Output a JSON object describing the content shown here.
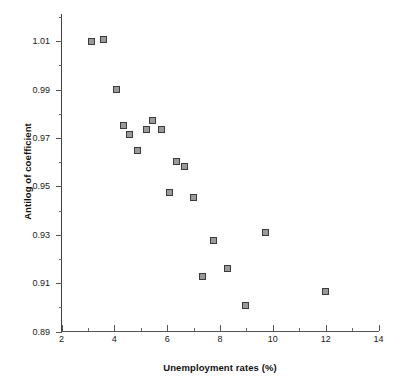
{
  "chart_data": {
    "type": "scatter",
    "title": "",
    "xlabel": "Unemployment rates (%)",
    "ylabel": "Antilog of coefficient",
    "xlim": [
      2,
      14
    ],
    "ylim": [
      0.89,
      1.02
    ],
    "grid": false,
    "legend": null,
    "xticks": [
      2,
      4,
      6,
      8,
      10,
      12,
      14
    ],
    "xtick_labels": [
      "2",
      "4",
      "6",
      "8",
      "10",
      "12",
      "14"
    ],
    "xminor_ticks": [
      3,
      5,
      7,
      9,
      11,
      13
    ],
    "yticks": [
      0.89,
      0.91,
      0.93,
      0.95,
      0.97,
      0.99,
      1.01
    ],
    "ytick_labels": [
      "0.89",
      "0.91",
      "0.93",
      "0.95",
      "0.97",
      "0.99",
      "1.01"
    ],
    "yminor_ticks": [
      0.9,
      0.92,
      0.94,
      0.96,
      0.98,
      1.0,
      1.02
    ],
    "marker": "open-square",
    "marker_color": "#3b3b3b",
    "points": [
      {
        "x": 3.15,
        "y": 1.0097
      },
      {
        "x": 3.58,
        "y": 1.0105
      },
      {
        "x": 4.1,
        "y": 0.99
      },
      {
        "x": 4.36,
        "y": 0.9752
      },
      {
        "x": 4.58,
        "y": 0.9713
      },
      {
        "x": 4.88,
        "y": 0.9648
      },
      {
        "x": 5.2,
        "y": 0.9734
      },
      {
        "x": 5.45,
        "y": 0.9773
      },
      {
        "x": 5.78,
        "y": 0.9734
      },
      {
        "x": 6.1,
        "y": 0.9476
      },
      {
        "x": 6.35,
        "y": 0.9604
      },
      {
        "x": 6.66,
        "y": 0.9583
      },
      {
        "x": 6.98,
        "y": 0.9454
      },
      {
        "x": 7.32,
        "y": 0.9126
      },
      {
        "x": 7.74,
        "y": 0.9276
      },
      {
        "x": 8.28,
        "y": 0.916
      },
      {
        "x": 8.95,
        "y": 0.9006
      },
      {
        "x": 9.74,
        "y": 0.931
      },
      {
        "x": 12.0,
        "y": 0.9065
      }
    ]
  }
}
